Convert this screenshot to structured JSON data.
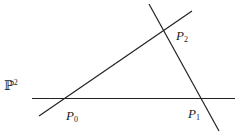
{
  "plane_label": {
    "base": "ℙ",
    "sup": "2"
  },
  "points": [
    {
      "name": "P",
      "sub": "0"
    },
    {
      "name": "P",
      "sub": "1"
    },
    {
      "name": "P",
      "sub": "2"
    }
  ],
  "colors": {
    "line": "#222222",
    "background": "#ffffff"
  }
}
